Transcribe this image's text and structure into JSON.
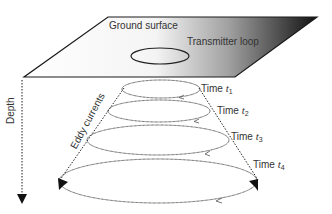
{
  "diagram": {
    "type": "schematic",
    "ground_surface": {
      "label": "Ground surface",
      "gradient_start": "#ffffff",
      "gradient_end": "#111111"
    },
    "transmitter_loop": {
      "label": "Transmitter loop"
    },
    "depth_axis": {
      "label": "Depth"
    },
    "eddy_currents": {
      "label": "Eddy currents"
    },
    "times": [
      {
        "prefix": "Time ",
        "var": "t",
        "sub": "1"
      },
      {
        "prefix": "Time ",
        "var": "t",
        "sub": "2"
      },
      {
        "prefix": "Time ",
        "var": "t",
        "sub": "3"
      },
      {
        "prefix": "Time ",
        "var": "t",
        "sub": "4"
      }
    ],
    "colors": {
      "line": "#222222",
      "dotted": "#333333",
      "text": "#333333"
    }
  }
}
